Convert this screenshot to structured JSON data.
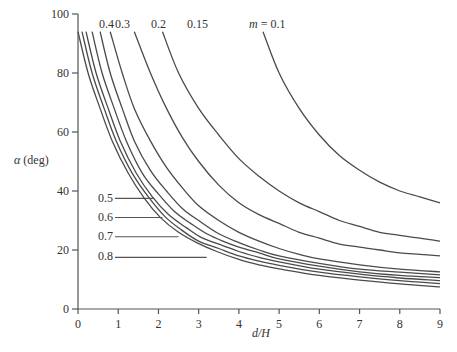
{
  "chart_data": {
    "type": "line",
    "title": "",
    "xlabel": "d/H",
    "ylabel": "α (deg)",
    "xlim": [
      0,
      9
    ],
    "ylim": [
      0,
      100
    ],
    "x_ticks": [
      "0",
      "1",
      "2",
      "3",
      "4",
      "5",
      "6",
      "7",
      "8",
      "9"
    ],
    "y_ticks": [
      "0",
      "20",
      "40",
      "60",
      "80",
      "100"
    ],
    "grid": false,
    "legend": "inline curve labels",
    "series": [
      {
        "name": "m = 0.1",
        "label": "m = 0.1",
        "points": [
          [
            4.6,
            94
          ],
          [
            5.0,
            80
          ],
          [
            5.5,
            68
          ],
          [
            6.0,
            59
          ],
          [
            6.5,
            52
          ],
          [
            7.0,
            47
          ],
          [
            7.5,
            43
          ],
          [
            8.0,
            40
          ],
          [
            8.5,
            38
          ],
          [
            9.0,
            36
          ]
        ]
      },
      {
        "name": "m = 0.15",
        "label": "0.15",
        "points": [
          [
            2.1,
            94
          ],
          [
            2.5,
            80
          ],
          [
            3.0,
            68
          ],
          [
            3.5,
            59
          ],
          [
            4.0,
            51
          ],
          [
            4.5,
            45
          ],
          [
            5.0,
            40
          ],
          [
            5.5,
            36
          ],
          [
            6.0,
            33
          ],
          [
            6.5,
            30
          ],
          [
            7.0,
            28
          ],
          [
            7.5,
            26
          ],
          [
            8.0,
            25
          ],
          [
            8.5,
            24
          ],
          [
            9.0,
            23
          ]
        ]
      },
      {
        "name": "m = 0.2",
        "label": "0.2",
        "points": [
          [
            1.4,
            94
          ],
          [
            1.8,
            80
          ],
          [
            2.2,
            68
          ],
          [
            2.6,
            58
          ],
          [
            3.0,
            50
          ],
          [
            3.5,
            42
          ],
          [
            4.0,
            36
          ],
          [
            4.5,
            32
          ],
          [
            5.0,
            29
          ],
          [
            5.5,
            26
          ],
          [
            6.0,
            24
          ],
          [
            6.5,
            22
          ],
          [
            7.0,
            21
          ],
          [
            7.5,
            20
          ],
          [
            8.0,
            19
          ],
          [
            8.5,
            18.5
          ],
          [
            9.0,
            18
          ]
        ]
      },
      {
        "name": "m = 0.3",
        "label": "0.3",
        "points": [
          [
            0.8,
            94
          ],
          [
            1.1,
            80
          ],
          [
            1.4,
            68
          ],
          [
            1.8,
            57
          ],
          [
            2.2,
            48
          ],
          [
            2.6,
            41
          ],
          [
            3.0,
            35
          ],
          [
            3.5,
            30
          ],
          [
            4.0,
            26
          ],
          [
            4.5,
            23
          ],
          [
            5.0,
            20.5
          ],
          [
            5.5,
            18.5
          ],
          [
            6.0,
            17
          ],
          [
            7.0,
            15
          ],
          [
            8.0,
            13.5
          ],
          [
            9.0,
            12.6
          ]
        ]
      },
      {
        "name": "m = 0.4",
        "label": "0.4",
        "points": [
          [
            0.55,
            94
          ],
          [
            0.8,
            80
          ],
          [
            1.1,
            68
          ],
          [
            1.4,
            57
          ],
          [
            1.8,
            47
          ],
          [
            2.2,
            40
          ],
          [
            2.6,
            34
          ],
          [
            3.0,
            30
          ],
          [
            3.5,
            25.5
          ],
          [
            4.0,
            22.5
          ],
          [
            4.5,
            20
          ],
          [
            5.0,
            18
          ],
          [
            6.0,
            15.5
          ],
          [
            7.0,
            13.5
          ],
          [
            8.0,
            12.5
          ],
          [
            9.0,
            11.6
          ]
        ]
      },
      {
        "name": "m = 0.5",
        "label": "0.5",
        "points": [
          [
            0.35,
            94
          ],
          [
            0.6,
            80
          ],
          [
            0.9,
            68
          ],
          [
            1.2,
            57
          ],
          [
            1.6,
            46
          ],
          [
            2.0,
            39
          ],
          [
            2.4,
            33
          ],
          [
            2.8,
            29
          ],
          [
            3.2,
            25.5
          ],
          [
            3.6,
            23
          ],
          [
            4.0,
            21
          ],
          [
            4.5,
            19
          ],
          [
            5.0,
            17
          ],
          [
            6.0,
            14.5
          ],
          [
            7.0,
            12.6
          ],
          [
            8.0,
            11.4
          ],
          [
            9.0,
            10.6
          ]
        ]
      },
      {
        "name": "m = 0.6",
        "label": "0.6",
        "points": [
          [
            0.2,
            94
          ],
          [
            0.45,
            80
          ],
          [
            0.75,
            68
          ],
          [
            1.05,
            57
          ],
          [
            1.45,
            46
          ],
          [
            1.85,
            38
          ],
          [
            2.25,
            32
          ],
          [
            2.7,
            27.5
          ],
          [
            3.1,
            24
          ],
          [
            3.6,
            21.5
          ],
          [
            4.0,
            19.5
          ],
          [
            4.5,
            17.5
          ],
          [
            5.0,
            16
          ],
          [
            6.0,
            13.5
          ],
          [
            7.0,
            11.8
          ],
          [
            8.0,
            10.5
          ],
          [
            9.0,
            9.6
          ]
        ]
      },
      {
        "name": "m = 0.7",
        "label": "0.7",
        "points": [
          [
            0.1,
            94
          ],
          [
            0.35,
            80
          ],
          [
            0.65,
            68
          ],
          [
            0.95,
            57
          ],
          [
            1.35,
            46
          ],
          [
            1.75,
            38
          ],
          [
            2.15,
            31.5
          ],
          [
            2.55,
            27
          ],
          [
            3.0,
            23
          ],
          [
            3.5,
            20.5
          ],
          [
            4.0,
            18
          ],
          [
            4.5,
            16.2
          ],
          [
            5.0,
            14.8
          ],
          [
            6.0,
            12.5
          ],
          [
            7.0,
            10.9
          ],
          [
            8.0,
            9.6
          ],
          [
            9.0,
            8.6
          ]
        ]
      },
      {
        "name": "m = 0.8",
        "label": "0.8",
        "points": [
          [
            0.0,
            94
          ],
          [
            0.25,
            80
          ],
          [
            0.55,
            68
          ],
          [
            0.85,
            57
          ],
          [
            1.25,
            46
          ],
          [
            1.65,
            37.5
          ],
          [
            2.05,
            31
          ],
          [
            2.5,
            26
          ],
          [
            2.95,
            22.5
          ],
          [
            3.45,
            19.5
          ],
          [
            4.0,
            16.8
          ],
          [
            4.5,
            15
          ],
          [
            5.0,
            13.6
          ],
          [
            6.0,
            11.4
          ],
          [
            7.0,
            9.8
          ],
          [
            8.0,
            8.5
          ],
          [
            9.0,
            7.5
          ]
        ]
      }
    ],
    "annotations": [
      {
        "text": "0.5",
        "leader_to_x": 1.9,
        "y": 37.5
      },
      {
        "text": "0.6",
        "leader_to_x": 2.1,
        "y": 31
      },
      {
        "text": "0.7",
        "leader_to_x": 2.5,
        "y": 24.5
      },
      {
        "text": "0.8",
        "leader_to_x": 3.2,
        "y": 17.5
      }
    ]
  },
  "labels": {
    "ylabel_alpha": "α",
    "ylabel_unit": "(deg)",
    "xlabel": "d/H",
    "top": {
      "l04": "0.4",
      "l03": "0.3",
      "l02": "0.2",
      "l015": "0.15",
      "l01_m": "m",
      "l01_rest": " = 0.1"
    },
    "side": {
      "l05": "0.5",
      "l06": "0.6",
      "l07": "0.7",
      "l08": "0.8"
    },
    "x_ticks": [
      "0",
      "1",
      "2",
      "3",
      "4",
      "5",
      "6",
      "7",
      "8",
      "9"
    ],
    "y_ticks": [
      "0",
      "20",
      "40",
      "60",
      "80",
      "100"
    ]
  }
}
